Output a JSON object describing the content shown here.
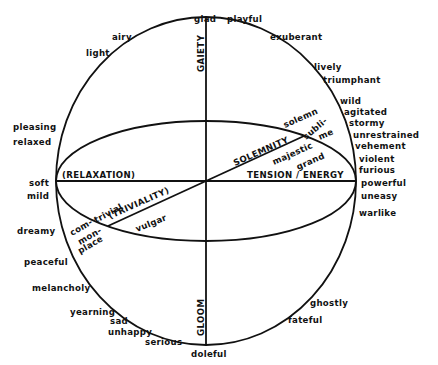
{
  "diagram": {
    "axes": {
      "gaiety": "GAIETY",
      "gloom": "GLOOM",
      "relaxation": "(RELAXATION)",
      "tension": "TENSION / ENERGY",
      "solemnity": "SOLEMNITY",
      "triviality": "(TRIVIALITY)"
    },
    "terms": {
      "glad": "glad",
      "playful": "playful",
      "exuberant": "exuberant",
      "lively": "lively",
      "triumphant": "triumphant",
      "wild": "wild",
      "agitated": "agitated",
      "stormy": "stormy",
      "unrestrained": "unrestrained",
      "vehement": "vehement",
      "violent": "violent",
      "furious": "furious",
      "powerful": "powerful",
      "uneasy": "uneasy",
      "warlike": "warlike",
      "ghostly": "ghostly",
      "fateful": "fateful",
      "doleful": "doleful",
      "serious": "serious",
      "unhappy": "unhappy",
      "sad": "sad",
      "yearning": "yearning",
      "melancholy": "melancholy",
      "peaceful": "peaceful",
      "dreamy": "dreamy",
      "mild": "mild",
      "soft": "soft",
      "relaxed": "relaxed",
      "pleasing": "pleasing",
      "light": "light",
      "airy": "airy",
      "solemn": "solemn",
      "subli": "subli-",
      "me": "me",
      "majestic": "majestic",
      "grand": "grand",
      "trivial": "trivial",
      "vulgar": "vulgar",
      "com": "com-",
      "mon": "mon-",
      "place": "place"
    }
  }
}
